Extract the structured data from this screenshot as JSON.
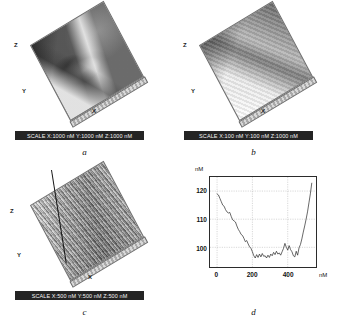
{
  "figure": {
    "panels": [
      {
        "id": "a",
        "caption": "a",
        "kind": "afm-3d-surface",
        "axis_labels": {
          "x": "X",
          "y": "Y",
          "z": "Z"
        },
        "scalebar": "SCALE  X:1000 nM Y:1000 nM Z:1000 nM"
      },
      {
        "id": "b",
        "caption": "b",
        "kind": "afm-3d-surface",
        "axis_labels": {
          "x": "X",
          "y": "Y",
          "z": "Z"
        },
        "scalebar": "SCALE  X:100 nM Y:100 nM Z:1000 nM"
      },
      {
        "id": "c",
        "caption": "c",
        "kind": "afm-3d-surface",
        "axis_labels": {
          "x": "X",
          "y": "Y",
          "z": "Z"
        },
        "scalebar": "SCALE  X:500 nM Y:500 nM Z:500 nM"
      },
      {
        "id": "d",
        "caption": "d",
        "kind": "line-profile-chart"
      }
    ]
  },
  "chart_data": {
    "type": "line",
    "title": "",
    "xlabel": "nM",
    "ylabel": "nM",
    "xlim": [
      -40,
      560
    ],
    "ylim": [
      93,
      125
    ],
    "xticks": [
      0,
      200,
      400
    ],
    "yticks": [
      100,
      110,
      120
    ],
    "grid": true,
    "legend": null,
    "series": [
      {
        "name": "height profile",
        "x": [
          0,
          8,
          16,
          24,
          32,
          40,
          48,
          56,
          64,
          72,
          80,
          88,
          96,
          104,
          112,
          120,
          128,
          136,
          144,
          152,
          160,
          168,
          176,
          184,
          192,
          200,
          208,
          216,
          224,
          232,
          240,
          248,
          256,
          264,
          272,
          280,
          288,
          296,
          304,
          312,
          320,
          328,
          336,
          344,
          352,
          360,
          368,
          376,
          384,
          392,
          400,
          408,
          416,
          424,
          432,
          440,
          448,
          456,
          464,
          472,
          480,
          488,
          496,
          504,
          512,
          520,
          528,
          536
        ],
        "y": [
          119.0,
          118.6,
          117.4,
          116.2,
          115.0,
          114.6,
          113.4,
          112.6,
          112.2,
          112.4,
          111.0,
          109.8,
          109.4,
          109.0,
          107.6,
          106.4,
          105.6,
          104.6,
          104.2,
          103.2,
          102.0,
          102.4,
          101.2,
          100.2,
          99.6,
          98.4,
          97.0,
          96.2,
          97.4,
          96.4,
          97.6,
          96.6,
          97.8,
          96.8,
          97.0,
          96.2,
          97.2,
          96.4,
          97.6,
          97.0,
          98.2,
          97.4,
          98.6,
          97.6,
          98.0,
          97.2,
          98.4,
          99.6,
          101.4,
          100.0,
          99.0,
          100.6,
          99.2,
          98.4,
          97.0,
          96.6,
          98.6,
          97.2,
          99.8,
          101.0,
          103.0,
          105.4,
          107.6,
          110.0,
          112.6,
          115.8,
          119.0,
          122.8
        ]
      }
    ]
  }
}
